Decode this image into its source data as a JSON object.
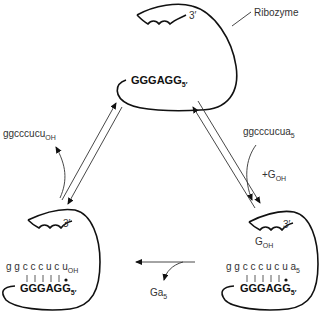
{
  "diagram": {
    "top": {
      "label": "Ribozyme",
      "three_prime": "3′",
      "strand": "GGGAGG",
      "strand_end": "5′"
    },
    "right": {
      "incoming_substrate": "ggcccucua",
      "incoming_substrate_sub": "5",
      "cofactor": "+G",
      "cofactor_sub": "OH",
      "three_prime": "3′",
      "bound_g": "G",
      "bound_g_sub": "OH",
      "substrate": "g g c c c u c u a",
      "substrate_sub": "5",
      "strand": "GGGAGG",
      "strand_end": "5′"
    },
    "bottom_arrow": {
      "released": "Ga",
      "released_sub": "5"
    },
    "left": {
      "three_prime": "3′",
      "substrate": "g g c c c u c u",
      "substrate_sub": "OH",
      "strand": "GGGAGG",
      "strand_end": "5′",
      "released_product": "ggcccucu",
      "released_product_sub": "OH"
    }
  }
}
